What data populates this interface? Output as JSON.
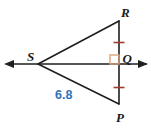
{
  "figure": {
    "points": {
      "R": "R",
      "S": "S",
      "Q": "Q",
      "P": "P"
    },
    "measurement": {
      "segment": "SP",
      "value": "6.8"
    },
    "marks": {
      "right_angle_at": "Q",
      "congruent_segments": [
        "RQ",
        "QP"
      ]
    },
    "colors": {
      "line": "#1f1f1f",
      "tick": "#a03d2d",
      "right_angle": "#e0a378",
      "measurement_text": "#3173bb",
      "label_text": "#1a1a1a"
    }
  }
}
